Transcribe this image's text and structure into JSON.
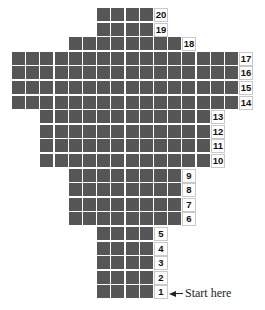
{
  "diagram": {
    "title": "",
    "cell_color": "#565656",
    "grid": {
      "origin_x": 12,
      "origin_y": 8,
      "pitch_x": 14.2,
      "pitch_y": 14.6
    },
    "rows": [
      {
        "label": "20",
        "start_col": 6,
        "count": 4
      },
      {
        "label": "19",
        "start_col": 6,
        "count": 4
      },
      {
        "label": "18",
        "start_col": 4,
        "count": 8
      },
      {
        "label": "17",
        "start_col": 0,
        "count": 16
      },
      {
        "label": "16",
        "start_col": 0,
        "count": 16
      },
      {
        "label": "15",
        "start_col": 0,
        "count": 16
      },
      {
        "label": "14",
        "start_col": 0,
        "count": 16
      },
      {
        "label": "13",
        "start_col": 2,
        "count": 12
      },
      {
        "label": "12",
        "start_col": 2,
        "count": 12
      },
      {
        "label": "11",
        "start_col": 2,
        "count": 12
      },
      {
        "label": "10",
        "start_col": 2,
        "count": 12
      },
      {
        "label": "9",
        "start_col": 4,
        "count": 8
      },
      {
        "label": "8",
        "start_col": 4,
        "count": 8
      },
      {
        "label": "7",
        "start_col": 4,
        "count": 8
      },
      {
        "label": "6",
        "start_col": 4,
        "count": 8
      },
      {
        "label": "5",
        "start_col": 6,
        "count": 4
      },
      {
        "label": "4",
        "start_col": 6,
        "count": 4
      },
      {
        "label": "3",
        "start_col": 6,
        "count": 4
      },
      {
        "label": "2",
        "start_col": 6,
        "count": 4
      },
      {
        "label": "1",
        "start_col": 6,
        "count": 4
      }
    ],
    "start_annotation": "Start here"
  }
}
